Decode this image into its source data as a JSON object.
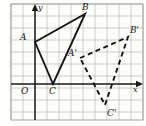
{
  "figure": {
    "type": "geometry-diagram",
    "width": 146,
    "height": 126,
    "background_color": "#fdfdfb",
    "grid": {
      "cell_size": 12,
      "left": 11,
      "top": 4,
      "right": 143,
      "bottom": 120,
      "columns": 11,
      "rows": 9.667,
      "line_color": "#b9b9b2",
      "border_color": "#9a9a92",
      "visible": true
    },
    "axes": {
      "origin": {
        "x": 35,
        "y": 84
      },
      "x_axis": {
        "label": "x",
        "from_x": 11,
        "to_x": 138,
        "y": 84,
        "arrow": true,
        "color": "#1a1a1a"
      },
      "y_axis": {
        "label": "y",
        "x": 35,
        "from_y": 120,
        "to_y": 9,
        "arrow": true,
        "color": "#1a1a1a"
      },
      "origin_label": "O"
    },
    "shapes": [
      {
        "name": "triangle-abc",
        "style": "solid",
        "stroke_color": "#141414",
        "stroke_width": 1.9,
        "vertices": [
          {
            "label": "A",
            "x": 35,
            "y": 42
          },
          {
            "label": "B",
            "x": 85,
            "y": 14
          },
          {
            "label": "C",
            "x": 53,
            "y": 84
          }
        ]
      },
      {
        "name": "triangle-a-prime-b-prime-c-prime",
        "style": "dashed",
        "stroke_color": "#141414",
        "stroke_width": 1.9,
        "dash_pattern": "5,3.5",
        "vertices": [
          {
            "label": "A'",
            "x": 80,
            "y": 58
          },
          {
            "label": "B'",
            "x": 128,
            "y": 37
          },
          {
            "label": "C'",
            "x": 105,
            "y": 105
          }
        ]
      }
    ],
    "labels": [
      {
        "id": "label-y-axis",
        "text": "y",
        "x": 38,
        "y": 4,
        "size": "sm"
      },
      {
        "id": "label-x-axis",
        "text": "x",
        "x": 133,
        "y": 86,
        "size": "sm"
      },
      {
        "id": "label-origin",
        "text": "O",
        "x": 21,
        "y": 87,
        "size": "md"
      },
      {
        "id": "label-a",
        "text": "A",
        "x": 20,
        "y": 33,
        "size": "md"
      },
      {
        "id": "label-b",
        "text": "B",
        "x": 82,
        "y": 3,
        "size": "md"
      },
      {
        "id": "label-c",
        "text": "C",
        "x": 49,
        "y": 87,
        "size": "md"
      },
      {
        "id": "label-a-prime",
        "text": "A'",
        "x": 68,
        "y": 49,
        "size": "md"
      },
      {
        "id": "label-b-prime",
        "text": "B'",
        "x": 130,
        "y": 26,
        "size": "md"
      },
      {
        "id": "label-c-prime",
        "text": "C'",
        "x": 107,
        "y": 109,
        "size": "md"
      }
    ]
  }
}
